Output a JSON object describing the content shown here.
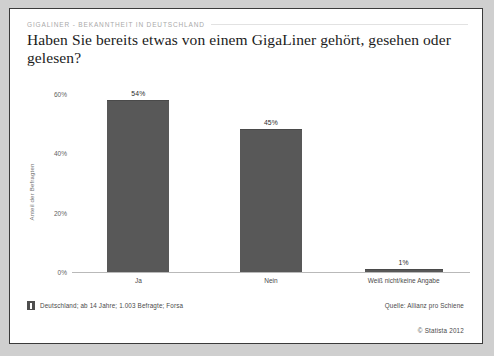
{
  "header": {
    "kicker": "GIGALINER - BEKANNTHEIT IN DEUTSCHLAND",
    "title": "Haben Sie bereits etwas von einem GigaLiner gehört, gesehen oder gelesen?"
  },
  "footer": {
    "info_icon": "info-square-icon",
    "note": "Deutschland; ab 14 Jahre; 1.003 Befragte; Forsa",
    "source": "Quelle: Allianz pro Schiene",
    "copyright": "© Statista 2012"
  },
  "colors": {
    "bar": "#585858",
    "card_background": "#ffffff",
    "page_background": "#cfcfcf",
    "border": "#3a3a3a",
    "kicker_text": "#a9a9a9"
  },
  "chart_data": {
    "type": "bar",
    "title": "Haben Sie bereits etwas von einem GigaLiner gehört, gesehen oder gelesen?",
    "categories": [
      "Ja",
      "Nein",
      "Weiß nicht/keine Angabe"
    ],
    "values": [
      54,
      45,
      1
    ],
    "value_labels": [
      "54%",
      "45%",
      "1%"
    ],
    "xlabel": "",
    "ylabel": "Anteil der Befragten",
    "ylim": [
      0,
      60
    ],
    "yticks": [
      0,
      20,
      40,
      60
    ],
    "ytick_labels": [
      "0%",
      "20%",
      "40%",
      "60%"
    ],
    "grid": false,
    "legend": false,
    "unit": "%"
  }
}
